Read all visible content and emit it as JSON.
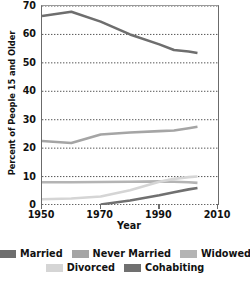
{
  "chart_data": {
    "type": "line",
    "title": "",
    "xlabel": "Year",
    "ylabel": "Percent of People 15 and Older",
    "xlim": [
      1950,
      2010
    ],
    "ylim": [
      0,
      70
    ],
    "xticks": [
      1950,
      1970,
      1990,
      2010
    ],
    "yticks": [
      0,
      10,
      20,
      30,
      40,
      50,
      60,
      70
    ],
    "grid": "horizontal-dotted",
    "legend_position": "bottom",
    "series": [
      {
        "name": "Married",
        "color": "#6e6e6e",
        "x": [
          1950,
          1960,
          1970,
          1980,
          1990,
          1995,
          2000,
          2003
        ],
        "values": [
          66.5,
          68.0,
          64.5,
          60.0,
          56.5,
          54.5,
          54.0,
          53.5
        ]
      },
      {
        "name": "Never Married",
        "color": "#a5a5a5",
        "x": [
          1950,
          1960,
          1970,
          1980,
          1990,
          1995,
          2000,
          2003
        ],
        "values": [
          22.5,
          21.8,
          24.8,
          25.5,
          26.0,
          26.2,
          27.0,
          27.5
        ]
      },
      {
        "name": "Widowed",
        "color": "#b4b4b4",
        "x": [
          1950,
          1960,
          1970,
          1980,
          1990,
          1995,
          2000,
          2003
        ],
        "values": [
          8.0,
          8.0,
          8.1,
          8.2,
          8.3,
          8.2,
          8.0,
          7.8
        ]
      },
      {
        "name": "Divorced",
        "color": "#d5d5d5",
        "x": [
          1950,
          1960,
          1970,
          1980,
          1990,
          1995,
          2000,
          2003
        ],
        "values": [
          2.0,
          2.3,
          3.0,
          5.2,
          8.2,
          9.2,
          9.8,
          10.0
        ]
      },
      {
        "name": "Cohabiting",
        "color": "#707070",
        "x": [
          1970,
          1980,
          1990,
          1995,
          2000,
          2003
        ],
        "values": [
          0.2,
          1.6,
          3.4,
          4.5,
          5.5,
          6.0
        ]
      }
    ]
  },
  "axes": {
    "y_title": "Percent of People 15 and Older",
    "x_title": "Year",
    "y_tick_labels": [
      "70",
      "60",
      "50",
      "40",
      "30",
      "20",
      "10",
      "0"
    ],
    "x_tick_labels": [
      "1950",
      "1970",
      "1990",
      "2010"
    ]
  },
  "legend": {
    "rows": [
      [
        {
          "label": "Married",
          "color": "#6e6e6e"
        },
        {
          "label": "Never Married",
          "color": "#a5a5a5"
        },
        {
          "label": "Widowed",
          "color": "#b4b4b4"
        }
      ],
      [
        {
          "label": "Divorced",
          "color": "#d5d5d5"
        },
        {
          "label": "Cohabiting",
          "color": "#707070"
        }
      ]
    ]
  }
}
